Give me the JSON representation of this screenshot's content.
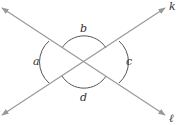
{
  "diagram": {
    "type": "intersecting-lines-angles",
    "lines": [
      {
        "name": "k",
        "label": "k",
        "from": [
          2,
          115
        ],
        "to": [
          165,
          8
        ]
      },
      {
        "name": "l",
        "label": "ℓ",
        "from": [
          2,
          8
        ],
        "to": [
          165,
          115
        ]
      }
    ],
    "intersection": [
      84,
      62
    ],
    "angles": [
      {
        "name": "a",
        "label": "a",
        "position": "left"
      },
      {
        "name": "b",
        "label": "b",
        "position": "top"
      },
      {
        "name": "c",
        "label": "c",
        "position": "right"
      },
      {
        "name": "d",
        "label": "d",
        "position": "bottom"
      }
    ],
    "colors": {
      "line": "#999999",
      "arc": "#555555",
      "text": "#333333"
    }
  }
}
